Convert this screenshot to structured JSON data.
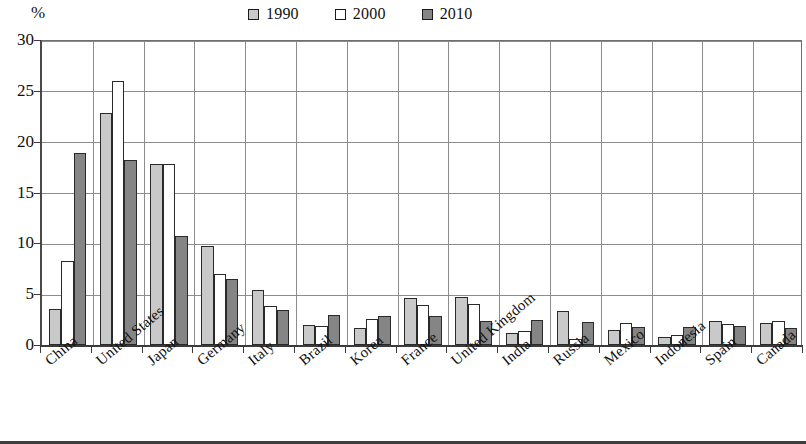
{
  "unit_label": "%",
  "legend": {
    "position": "top-center",
    "entries": [
      {
        "label": "1990",
        "color": "#c9c9c9"
      },
      {
        "label": "2000",
        "color": "#ffffff"
      },
      {
        "label": "2010",
        "color": "#858585"
      }
    ]
  },
  "y_axis": {
    "ticks": [
      "0",
      "5",
      "10",
      "15",
      "20",
      "25",
      "30"
    ],
    "min": 0,
    "max": 30
  },
  "chart_data": {
    "type": "bar",
    "title": "",
    "subtitle": "",
    "xlabel": "",
    "ylabel": "%",
    "ylim": [
      0,
      30
    ],
    "ytick_values": [
      0,
      5,
      10,
      15,
      20,
      25,
      30
    ],
    "grid": true,
    "legend_position": "top-center",
    "categories": [
      "China",
      "United States",
      "Japan",
      "Germany",
      "Italy",
      "Brazil",
      "Korea",
      "France",
      "United Kingdom",
      "India",
      "Russia",
      "Mexico",
      "Indonesia",
      "Spain",
      "Canada"
    ],
    "series": [
      {
        "name": "1990",
        "color": "#c9c9c9",
        "values": [
          3.5,
          22.8,
          17.8,
          9.7,
          5.4,
          2.0,
          1.7,
          4.6,
          4.7,
          1.2,
          3.3,
          1.5,
          0.8,
          2.4,
          2.2
        ]
      },
      {
        "name": "2000",
        "color": "#ffffff",
        "values": [
          8.3,
          26.0,
          17.8,
          7.0,
          3.8,
          1.9,
          2.6,
          3.9,
          4.0,
          1.4,
          0.6,
          2.2,
          1.0,
          2.1,
          2.4
        ]
      },
      {
        "name": "2010",
        "color": "#858585",
        "values": [
          18.9,
          18.2,
          10.7,
          6.5,
          3.4,
          3.0,
          2.9,
          2.9,
          2.4,
          2.5,
          2.3,
          1.8,
          1.8,
          1.9,
          1.7
        ]
      }
    ]
  }
}
